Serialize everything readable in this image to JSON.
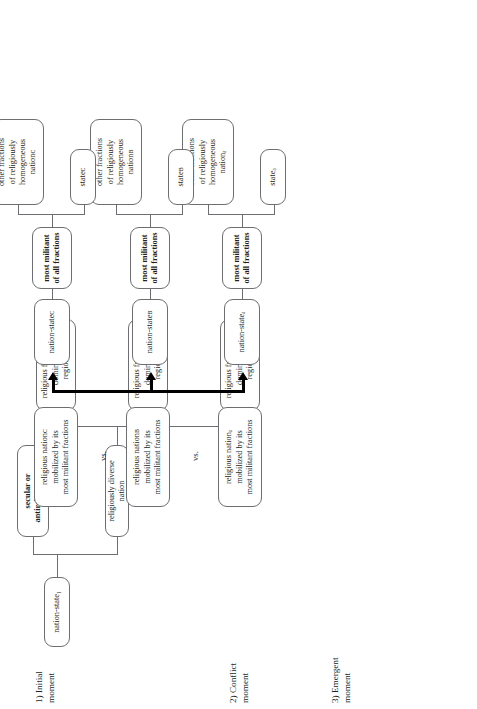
{
  "diagram": {
    "type": "flow-diagram",
    "orientation": "rotated-90-ccw",
    "rows": [
      {
        "id": "initial",
        "label": "1) Initial\nmoment"
      },
      {
        "id": "conflict",
        "label": "2) Conflict\nmoment"
      },
      {
        "id": "emergent",
        "label": "3) Emergent\nmoment"
      }
    ],
    "initial": {
      "root": "nation-state₁",
      "branches": [
        {
          "id": "secular",
          "label": "secular or\nantireligious state",
          "bold": true
        },
        {
          "id": "diverse",
          "label": "religiously diverse nation",
          "bold": false
        }
      ],
      "fractions": [
        {
          "id": "A",
          "label": "religious fraction A,\ndominant in\nregion A"
        },
        {
          "id": "B",
          "label": "religious fraction B,\ndominant in\nregion B"
        },
        {
          "id": "C",
          "label": "religious fraction C,\ndominant in\nregion C"
        }
      ]
    },
    "conflict": {
      "separator": "vs.",
      "nations": [
        {
          "id": "A",
          "label": "religious nationₐ\nmobilized by its\nmost militant fractions"
        },
        {
          "id": "B",
          "label": "religious nationʙ\nmobilized by its\nmost militant fractions"
        },
        {
          "id": "C",
          "label": "religious nationᴄ\nmobilized by its\nmost militant fractions"
        }
      ]
    },
    "emergent": {
      "groups": [
        {
          "id": "A",
          "nation_state": "nation-stateₐ",
          "militant": "most militant\nof all fractions",
          "others": "other fractions\nof religiously\nhomogeneous\nnationₐ",
          "state": "stateₐ"
        },
        {
          "id": "B",
          "nation_state": "nation-stateʙ",
          "militant": "most militant\nof all fractions",
          "others": "other fractions\nof religiously\nhomogeneous\nnationʙ",
          "state": "stateʙ"
        },
        {
          "id": "C",
          "nation_state": "nation-stateᴄ",
          "militant": "most militant\nof all fractions",
          "others": "other fractions\nof religiously\nhomogeneous\nnationᴄ",
          "state": "stateᴄ"
        }
      ]
    },
    "colors": {
      "box_border": "#6d6e71",
      "text": "#231f20",
      "trunk": "#000000",
      "background": "#ffffff"
    }
  }
}
